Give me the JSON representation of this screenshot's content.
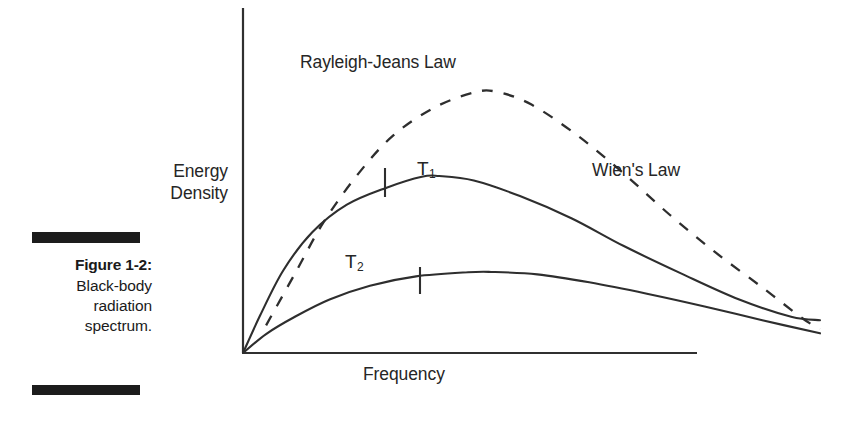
{
  "figure": {
    "caption_title": "Figure 1-2:",
    "caption_lines": [
      "Black-body",
      "radiation",
      "spectrum."
    ]
  },
  "chart_data": {
    "type": "line",
    "title": "",
    "xlabel": "Frequency",
    "ylabel_line1": "Energy",
    "ylabel_line2": "Density",
    "ylabel": "Energy Density",
    "grid": false,
    "axis_ticks_shown": false,
    "legend": "inline-annotations",
    "xlim": [
      0,
      1
    ],
    "ylim": [
      0,
      1
    ],
    "annotations": [
      {
        "name": "rayleigh-jeans-law",
        "text": "Rayleigh-Jeans Law"
      },
      {
        "name": "wien-law",
        "text": "Wien's Law"
      },
      {
        "name": "t1-curve-label",
        "text": "T",
        "subscript": "1"
      },
      {
        "name": "t2-curve-label",
        "text": "T",
        "subscript": "2"
      }
    ],
    "series": [
      {
        "name": "Rayleigh-Jeans Law",
        "style": "dashed",
        "color": "#2e2e2e",
        "peak_x": 0.44,
        "peak_y": 0.76,
        "points": [
          [
            0.04,
            0.08
          ],
          [
            0.09,
            0.23
          ],
          [
            0.14,
            0.38
          ],
          [
            0.2,
            0.52
          ],
          [
            0.26,
            0.63
          ],
          [
            0.33,
            0.71
          ],
          [
            0.4,
            0.755
          ],
          [
            0.44,
            0.757
          ],
          [
            0.5,
            0.72
          ],
          [
            0.58,
            0.63
          ],
          [
            0.66,
            0.52
          ],
          [
            0.74,
            0.4
          ],
          [
            0.82,
            0.29
          ],
          [
            0.9,
            0.19
          ],
          [
            0.97,
            0.1
          ],
          [
            1.0,
            0.07
          ]
        ]
      },
      {
        "name": "T1",
        "style": "solid",
        "color": "#2e2e2e",
        "peak_x": 0.34,
        "peak_y": 0.513,
        "tick_x": 0.31,
        "points": [
          [
            0.0,
            0.0
          ],
          [
            0.03,
            0.11
          ],
          [
            0.07,
            0.24
          ],
          [
            0.12,
            0.35
          ],
          [
            0.18,
            0.43
          ],
          [
            0.25,
            0.48
          ],
          [
            0.31,
            0.511
          ],
          [
            0.34,
            0.513
          ],
          [
            0.4,
            0.5
          ],
          [
            0.48,
            0.455
          ],
          [
            0.57,
            0.39
          ],
          [
            0.66,
            0.31
          ],
          [
            0.76,
            0.23
          ],
          [
            0.86,
            0.155
          ],
          [
            0.95,
            0.105
          ],
          [
            1.0,
            0.095
          ]
        ]
      },
      {
        "name": "T2",
        "style": "solid",
        "color": "#2e2e2e",
        "peak_x": 0.43,
        "peak_y": 0.235,
        "tick_x": 0.39,
        "points": [
          [
            0.0,
            0.0
          ],
          [
            0.04,
            0.055
          ],
          [
            0.09,
            0.105
          ],
          [
            0.15,
            0.155
          ],
          [
            0.22,
            0.195
          ],
          [
            0.3,
            0.222
          ],
          [
            0.39,
            0.234
          ],
          [
            0.43,
            0.235
          ],
          [
            0.51,
            0.228
          ],
          [
            0.6,
            0.205
          ],
          [
            0.7,
            0.172
          ],
          [
            0.8,
            0.135
          ],
          [
            0.9,
            0.095
          ],
          [
            1.0,
            0.057
          ]
        ]
      }
    ]
  }
}
